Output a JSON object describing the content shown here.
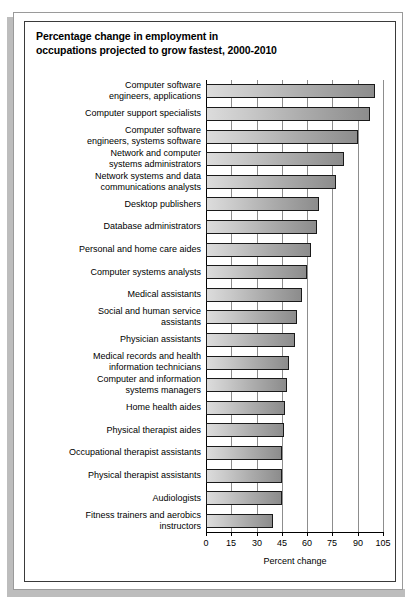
{
  "figure": {
    "title_line1": "Percentage change in employment in",
    "title_line2": "occupations projected to grow fastest, 2000-2010"
  },
  "chart_data": {
    "type": "bar",
    "orientation": "horizontal",
    "title": "Percentage change in employment in occupations projected to grow fastest, 2000-2010",
    "xlabel": "Percent change",
    "ylabel": "",
    "xlim": [
      0,
      105
    ],
    "xticks": [
      0,
      15,
      30,
      45,
      60,
      75,
      90,
      105
    ],
    "xtick_labels": [
      "0",
      "15",
      "30",
      "45",
      "60",
      "75",
      "90",
      "105"
    ],
    "grid": true,
    "grid_axis": "x",
    "legend": false,
    "bar_fill_start": "#dcdcdc",
    "bar_fill_end": "#8c8c8c",
    "bar_border": "#1a1a1a",
    "categories": [
      "Computer software engineers, applications",
      "Computer support specialists",
      "Computer software engineers, systems software",
      "Network and computer systems administrators",
      "Network systems and data communications analysts",
      "Desktop publishers",
      "Database administrators",
      "Personal and home care aides",
      "Computer systems analysts",
      "Medical assistants",
      "Social and human service assistants",
      "Physician assistants",
      "Medical records and health information technicians",
      "Computer and information systems managers",
      "Home health aides",
      "Physical therapist aides",
      "Occupational therapist assistants",
      "Physical therapist assistants",
      "Audiologists",
      "Fitness trainers and aerobics instructors"
    ],
    "category_lines": [
      [
        "Computer software",
        "engineers, applications"
      ],
      [
        "Computer support specialists"
      ],
      [
        "Computer software",
        "engineers, systems software"
      ],
      [
        "Network and computer",
        "systems administrators"
      ],
      [
        "Network systems and data",
        "communications analysts"
      ],
      [
        "Desktop publishers"
      ],
      [
        "Database administrators"
      ],
      [
        "Personal and home care aides"
      ],
      [
        "Computer systems analysts"
      ],
      [
        "Medical assistants"
      ],
      [
        "Social and human service",
        "assistants"
      ],
      [
        "Physician assistants"
      ],
      [
        "Medical records and health",
        "information technicians"
      ],
      [
        "Computer and information",
        "systems managers"
      ],
      [
        "Home health aides"
      ],
      [
        "Physical therapist aides"
      ],
      [
        "Occupational therapist assistants"
      ],
      [
        "Physical therapist assistants"
      ],
      [
        "Audiologists"
      ],
      [
        "Fitness trainers and aerobics",
        "instructors"
      ]
    ],
    "values": [
      100,
      97,
      90,
      82,
      77,
      67,
      66,
      62,
      60,
      57,
      54,
      53,
      49,
      48,
      47,
      46,
      45,
      45,
      45,
      40
    ]
  }
}
